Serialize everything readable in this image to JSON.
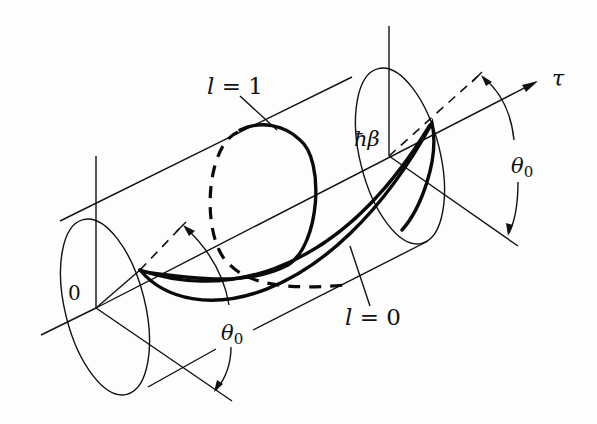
{
  "diagram": {
    "labels": {
      "l1": "l = 1",
      "l0": "l = 0",
      "origin": "0",
      "hbar_beta": "ħβ",
      "tau": "τ",
      "theta0_right": "θ₀",
      "theta0_left": "θ₀"
    },
    "paths": [
      {
        "name": "l=1",
        "winding": 1,
        "style": "thick, partly dashed (behind cylinder)"
      },
      {
        "name": "l=0",
        "winding": 0,
        "style": "thick"
      }
    ],
    "axes": {
      "time_axis": "τ",
      "start": "0",
      "end": "ħβ"
    },
    "colors": {
      "line": "#111111",
      "background": "#fdfdfd"
    }
  }
}
